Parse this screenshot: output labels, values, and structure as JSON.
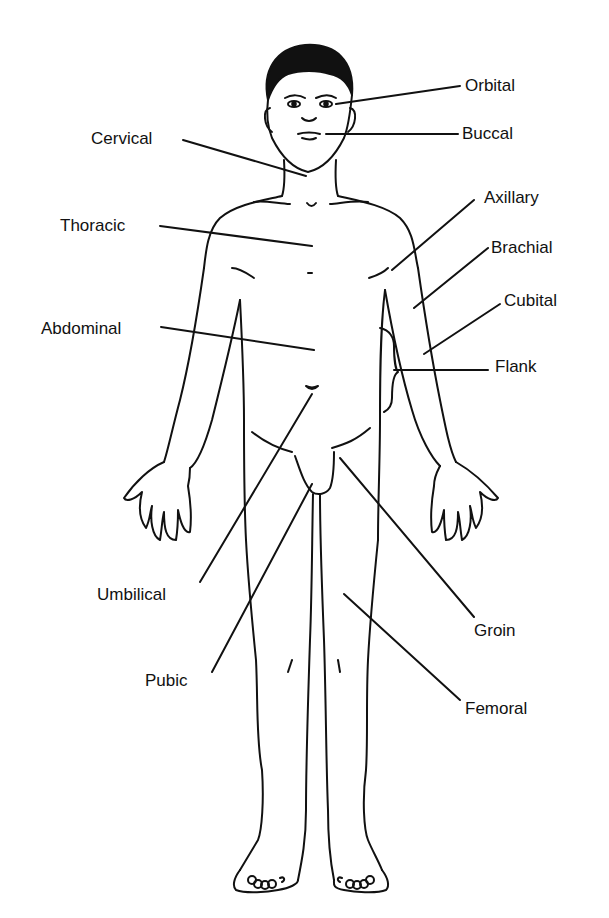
{
  "diagram": {
    "type": "anatomical-regions-anterior",
    "stroke_color": "#111111",
    "background": "#ffffff",
    "labels": [
      {
        "id": "orbital",
        "text": "Orbital",
        "side": "right"
      },
      {
        "id": "buccal",
        "text": "Buccal",
        "side": "right"
      },
      {
        "id": "cervical",
        "text": "Cervical",
        "side": "left"
      },
      {
        "id": "axillary",
        "text": "Axillary",
        "side": "right"
      },
      {
        "id": "thoracic",
        "text": "Thoracic",
        "side": "left"
      },
      {
        "id": "brachial",
        "text": "Brachial",
        "side": "right"
      },
      {
        "id": "cubital",
        "text": "Cubital",
        "side": "right"
      },
      {
        "id": "abdominal",
        "text": "Abdominal",
        "side": "left"
      },
      {
        "id": "flank",
        "text": "Flank",
        "side": "right"
      },
      {
        "id": "umbilical",
        "text": "Umbilical",
        "side": "left"
      },
      {
        "id": "groin",
        "text": "Groin",
        "side": "right"
      },
      {
        "id": "pubic",
        "text": "Pubic",
        "side": "left"
      },
      {
        "id": "femoral",
        "text": "Femoral",
        "side": "right"
      }
    ]
  }
}
